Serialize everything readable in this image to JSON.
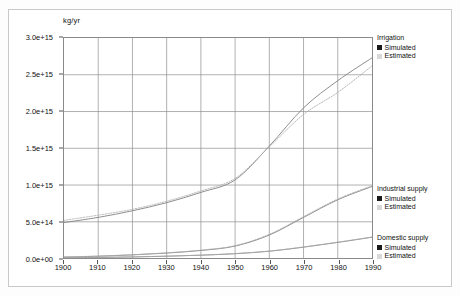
{
  "figure": {
    "y_axis_unit": "kg/yr"
  },
  "chart_data": {
    "type": "line",
    "title": "",
    "xlabel": "",
    "ylabel": "kg/yr",
    "xlim": [
      1900,
      1990
    ],
    "ylim": [
      0.0,
      3000000000000000.0
    ],
    "grid": true,
    "legend_position": "right-inside",
    "x_ticks": [
      1900,
      1910,
      1920,
      1930,
      1940,
      1950,
      1960,
      1970,
      1980,
      1990
    ],
    "x_tick_labels": [
      "1900",
      "1910",
      "1920",
      "1930",
      "1940",
      "1950",
      "1960",
      "1970",
      "1980",
      "1990"
    ],
    "y_ticks": [
      0.0,
      500000000000000.0,
      1000000000000000.0,
      1500000000000000.0,
      2000000000000000.0,
      2500000000000000.0,
      3000000000000000.0
    ],
    "y_tick_labels": [
      "0.0e+00",
      "5.0e+14",
      "1.0e+15",
      "1.5e+15",
      "2.0e+15",
      "2.5e+15",
      "3.0e+15"
    ],
    "x": [
      1900,
      1910,
      1920,
      1930,
      1940,
      1950,
      1960,
      1970,
      1980,
      1990
    ],
    "series": [
      {
        "name": "Irrigation Simulated",
        "group": "Irrigation",
        "kind": "Simulated",
        "style": "solid",
        "color": "#808080",
        "values": [
          490000000000000.0,
          560000000000000.0,
          650000000000000.0,
          760000000000000.0,
          900000000000000.0,
          1070000000000000.0,
          1530000000000000.0,
          2050000000000000.0,
          2420000000000000.0,
          2730000000000000.0
        ]
      },
      {
        "name": "Irrigation Estimated",
        "group": "Irrigation",
        "kind": "Estimated",
        "style": "dotted",
        "color": "#b0b0b0",
        "values": [
          520000000000000.0,
          590000000000000.0,
          670000000000000.0,
          780000000000000.0,
          920000000000000.0,
          1090000000000000.0,
          1520000000000000.0,
          1960000000000000.0,
          2260000000000000.0,
          2620000000000000.0
        ]
      },
      {
        "name": "Industrial supply Simulated",
        "group": "Industrial supply",
        "kind": "Simulated",
        "style": "solid",
        "color": "#808080",
        "values": [
          20000000000000.0,
          32000000000000.0,
          50000000000000.0,
          75000000000000.0,
          110000000000000.0,
          170000000000000.0,
          320000000000000.0,
          560000000000000.0,
          800000000000000.0,
          980000000000000.0
        ]
      },
      {
        "name": "Industrial supply Estimated",
        "group": "Industrial supply",
        "kind": "Estimated",
        "style": "dotted",
        "color": "#b0b0b0",
        "values": [
          22000000000000.0,
          34000000000000.0,
          52000000000000.0,
          78000000000000.0,
          115000000000000.0,
          175000000000000.0,
          330000000000000.0,
          570000000000000.0,
          810000000000000.0,
          990000000000000.0
        ]
      },
      {
        "name": "Domestic supply Simulated",
        "group": "Domestic supply",
        "kind": "Simulated",
        "style": "solid",
        "color": "#808080",
        "values": [
          10000000000000.0,
          15000000000000.0,
          22000000000000.0,
          32000000000000.0,
          46000000000000.0,
          66000000000000.0,
          100000000000000.0,
          155000000000000.0,
          220000000000000.0,
          290000000000000.0
        ]
      },
      {
        "name": "Domestic supply Estimated",
        "group": "Domestic supply",
        "kind": "Estimated",
        "style": "dotted",
        "color": "#b0b0b0",
        "values": [
          11000000000000.0,
          16000000000000.0,
          23000000000000.0,
          33000000000000.0,
          47000000000000.0,
          68000000000000.0,
          102000000000000.0,
          158000000000000.0,
          223000000000000.0,
          293000000000000.0
        ]
      }
    ],
    "legends": [
      {
        "title": "Irrigation",
        "entries": [
          {
            "label": "Simulated",
            "swatch": "filled-black"
          },
          {
            "label": "Estimated",
            "swatch": "light-gray"
          }
        ]
      },
      {
        "title": "Industrial supply",
        "entries": [
          {
            "label": "Simulated",
            "swatch": "filled-black"
          },
          {
            "label": "Estimated",
            "swatch": "light-gray"
          }
        ]
      },
      {
        "title": "Domestic supply",
        "entries": [
          {
            "label": "Simulated",
            "swatch": "filled-black"
          },
          {
            "label": "Estimated",
            "swatch": "light-gray"
          }
        ]
      }
    ]
  }
}
